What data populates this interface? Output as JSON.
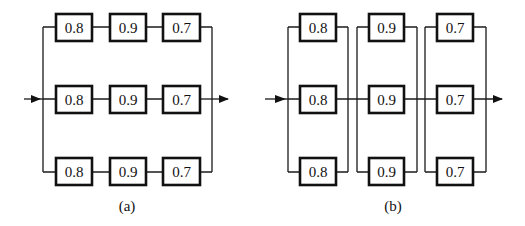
{
  "figure": {
    "panels": [
      {
        "id": "a",
        "caption": "(a)",
        "description": "Three parallel paths, each a series chain of three components",
        "rows": [
          [
            "0.8",
            "0.9",
            "0.7"
          ],
          [
            "0.8",
            "0.9",
            "0.7"
          ],
          [
            "0.8",
            "0.9",
            "0.7"
          ]
        ]
      },
      {
        "id": "b",
        "caption": "(b)",
        "description": "Three series stages, each stage three identical components in parallel",
        "stages": [
          [
            "0.8",
            "0.8",
            "0.8"
          ],
          [
            "0.9",
            "0.9",
            "0.9"
          ],
          [
            "0.7",
            "0.7",
            "0.7"
          ]
        ]
      }
    ],
    "colors": {
      "line": "#1a1a1a",
      "box_border": "#111111",
      "background": "#ffffff"
    }
  }
}
